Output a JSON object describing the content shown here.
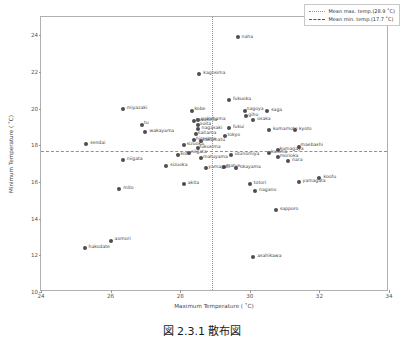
{
  "chart_data": {
    "type": "scatter",
    "title": "",
    "xlabel": "Maximum Temperature ( ˚C)",
    "ylabel": "Minimum Temperature ( ˚C)",
    "xlim": [
      24,
      34
    ],
    "ylim": [
      10,
      25
    ],
    "xticks": [
      24,
      26,
      28,
      30,
      32,
      34
    ],
    "yticks": [
      10,
      12,
      14,
      16,
      18,
      20,
      22,
      24
    ],
    "grid": false,
    "legend_position": "upper-right",
    "mean_max_temp": 28.9,
    "mean_min_temp": 17.7,
    "legend": [
      {
        "label": "Mean max. temp.(28.9 ˚C)",
        "style": "dotted"
      },
      {
        "label": "Mean min. temp.(17.7 ˚C)",
        "style": "dashed"
      }
    ],
    "marker_color": "#4d4d52",
    "points": [
      {
        "label": "naha",
        "x": 29.65,
        "y": 23.9,
        "lx": 4,
        "ly": -2
      },
      {
        "label": "kagosima",
        "x": 28.55,
        "y": 21.9,
        "lx": 4,
        "ly": -3
      },
      {
        "label": "fukuoka",
        "x": 29.4,
        "y": 20.45,
        "lx": 4,
        "ly": -3
      },
      {
        "label": "miyazaki",
        "x": 26.35,
        "y": 20.0,
        "lx": 4,
        "ly": -3
      },
      {
        "label": "kobe",
        "x": 28.35,
        "y": 19.9,
        "lx": 2,
        "ly": -4
      },
      {
        "label": "saga",
        "x": 30.5,
        "y": 19.9,
        "lx": 4,
        "ly": -3
      },
      {
        "label": "nagoya",
        "x": 29.85,
        "y": 19.85,
        "lx": 2,
        "ly": -4
      },
      {
        "label": "gihu",
        "x": 29.9,
        "y": 19.6,
        "lx": 2,
        "ly": -3
      },
      {
        "label": "osaka",
        "x": 30.1,
        "y": 19.4,
        "lx": 4,
        "ly": -3
      },
      {
        "label": "tokusima",
        "x": 28.4,
        "y": 19.35,
        "lx": 2,
        "ly": -3
      },
      {
        "label": "yokohama",
        "x": 28.5,
        "y": 19.4,
        "lx": 4,
        "ly": -3
      },
      {
        "label": "tu",
        "x": 26.9,
        "y": 19.1,
        "lx": 2,
        "ly": -4
      },
      {
        "label": "ooita",
        "x": 28.5,
        "y": 19.1,
        "lx": 2,
        "ly": -3
      },
      {
        "label": "wakayama",
        "x": 27.0,
        "y": 18.75,
        "lx": 4,
        "ly": -3
      },
      {
        "label": "nagasaki",
        "x": 28.5,
        "y": 18.9,
        "lx": 4,
        "ly": -3
      },
      {
        "label": "kumamoto",
        "x": 30.55,
        "y": 18.85,
        "lx": 4,
        "ly": -3
      },
      {
        "label": "kyoto",
        "x": 31.3,
        "y": 18.85,
        "lx": 4,
        "ly": -3
      },
      {
        "label": "fukui",
        "x": 29.4,
        "y": 18.95,
        "lx": 4,
        "ly": -3
      },
      {
        "label": "saitama",
        "x": 28.45,
        "y": 18.6,
        "lx": 2,
        "ly": -3
      },
      {
        "label": "tokyo",
        "x": 29.3,
        "y": 18.5,
        "lx": 2,
        "ly": -3
      },
      {
        "label": "sendai",
        "x": 25.3,
        "y": 18.1,
        "lx": 4,
        "ly": -3
      },
      {
        "label": "hirosima",
        "x": 28.4,
        "y": 18.3,
        "lx": 2,
        "ly": -3
      },
      {
        "label": "takamatu",
        "x": 28.6,
        "y": 18.25,
        "lx": 2,
        "ly": -3
      },
      {
        "label": "sizuoka2",
        "x": 28.1,
        "y": 18.0,
        "lx": 3,
        "ly": -3
      },
      {
        "label": "maebashi",
        "x": 31.4,
        "y": 17.9,
        "lx": 2,
        "ly": -4
      },
      {
        "label": "kumagaya",
        "x": 30.8,
        "y": 17.75,
        "lx": 2,
        "ly": -3
      },
      {
        "label": "fukusima",
        "x": 28.5,
        "y": 17.85,
        "lx": 2,
        "ly": -3
      },
      {
        "label": "koti",
        "x": 27.95,
        "y": 17.5,
        "lx": 2,
        "ly": -3
      },
      {
        "label": "niigata2",
        "x": 28.25,
        "y": 17.6,
        "lx": 2,
        "ly": -3
      },
      {
        "label": "kusima",
        "x": 30.55,
        "y": 17.6,
        "lx": 2,
        "ly": -3
      },
      {
        "label": "utunomiya",
        "x": 29.45,
        "y": 17.5,
        "lx": 4,
        "ly": -3
      },
      {
        "label": "matuyama",
        "x": 28.6,
        "y": 17.3,
        "lx": 2,
        "ly": -3
      },
      {
        "label": "niigata",
        "x": 26.35,
        "y": 17.2,
        "lx": 4,
        "ly": -3
      },
      {
        "label": "morioka",
        "x": 30.8,
        "y": 17.35,
        "lx": 2,
        "ly": -3
      },
      {
        "label": "nara",
        "x": 31.1,
        "y": 17.15,
        "lx": 4,
        "ly": -3
      },
      {
        "label": "sizuoka",
        "x": 27.6,
        "y": 16.9,
        "lx": 4,
        "ly": -3
      },
      {
        "label": "matue",
        "x": 29.25,
        "y": 16.8,
        "lx": 2,
        "ly": -3
      },
      {
        "label": "okayama",
        "x": 29.6,
        "y": 16.75,
        "lx": 4,
        "ly": -3
      },
      {
        "label": "yamaguti",
        "x": 28.75,
        "y": 16.75,
        "lx": 2,
        "ly": -3
      },
      {
        "label": "yamagata",
        "x": 31.4,
        "y": 16.0,
        "lx": 4,
        "ly": -3
      },
      {
        "label": "koofu",
        "x": 32.0,
        "y": 16.2,
        "lx": 4,
        "ly": -3
      },
      {
        "label": "akita",
        "x": 28.1,
        "y": 15.9,
        "lx": 4,
        "ly": -3
      },
      {
        "label": "totori",
        "x": 30.0,
        "y": 15.9,
        "lx": 4,
        "ly": -3
      },
      {
        "label": "mito",
        "x": 26.25,
        "y": 15.6,
        "lx": 4,
        "ly": -3
      },
      {
        "label": "nagano",
        "x": 30.15,
        "y": 15.5,
        "lx": 4,
        "ly": -3
      },
      {
        "label": "sapporo",
        "x": 30.75,
        "y": 14.5,
        "lx": 4,
        "ly": -3
      },
      {
        "label": "aomori",
        "x": 26.0,
        "y": 12.8,
        "lx": 4,
        "ly": -4
      },
      {
        "label": "hakodate",
        "x": 25.25,
        "y": 12.4,
        "lx": 4,
        "ly": -3
      },
      {
        "label": "asahikawa",
        "x": 30.1,
        "y": 11.9,
        "lx": 4,
        "ly": -3
      }
    ]
  },
  "caption": {
    "text": "図 2.3.1   散布図"
  }
}
